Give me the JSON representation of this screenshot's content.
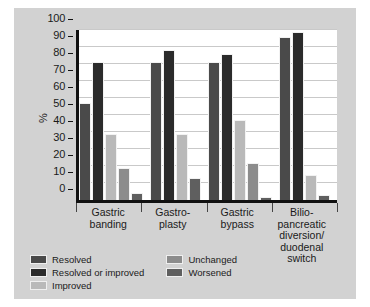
{
  "chart_data": {
    "type": "bar",
    "title": "",
    "xlabel": "",
    "ylabel": "%",
    "ylim": [
      0,
      100
    ],
    "yticks": [
      0,
      10,
      20,
      30,
      40,
      50,
      60,
      70,
      80,
      90,
      100
    ],
    "grid": true,
    "legend_position": "bottom-left",
    "categories": [
      "Gastric banding",
      "Gastro- plasty",
      "Gastric bypass",
      "Bilio- pancreatic diversion/ duodenal switch"
    ],
    "category_lines": [
      [
        "Gastric",
        "banding"
      ],
      [
        "Gastro-",
        "plasty"
      ],
      [
        "Gastric",
        "bypass"
      ],
      [
        "Bilio-",
        "pancreatic",
        "diversion/",
        "duodenal",
        "switch"
      ]
    ],
    "series": [
      {
        "name": "Resolved",
        "color": "#4a4a4a",
        "values": [
          57,
          81,
          81,
          96
        ]
      },
      {
        "name": "Resolved or improved",
        "color": "#2b2b2b",
        "values": [
          81,
          88,
          86,
          99
        ]
      },
      {
        "name": "Improved",
        "color": "#b9b9b9",
        "values": [
          39,
          39,
          47,
          15
        ]
      },
      {
        "name": "Unchanged",
        "color": "#8c8c8c",
        "values": [
          19,
          0,
          22,
          0
        ]
      },
      {
        "name": "Worsened",
        "color": "#5f5f5f",
        "values": [
          4,
          13,
          2,
          3
        ]
      }
    ]
  },
  "legend": {
    "items": [
      {
        "label": "Resolved",
        "color": "#4a4a4a"
      },
      {
        "label": "Unchanged",
        "color": "#8c8c8c"
      },
      {
        "label": "Resolved or improved",
        "color": "#2b2b2b"
      },
      {
        "label": "Worsened",
        "color": "#5f5f5f"
      },
      {
        "label": "Improved",
        "color": "#b9b9b9"
      }
    ]
  },
  "axis": {
    "y_label": "%",
    "y_tick_labels": [
      "100",
      "90",
      "80",
      "70",
      "60",
      "50",
      "40",
      "30",
      "20",
      "10",
      "0"
    ]
  }
}
